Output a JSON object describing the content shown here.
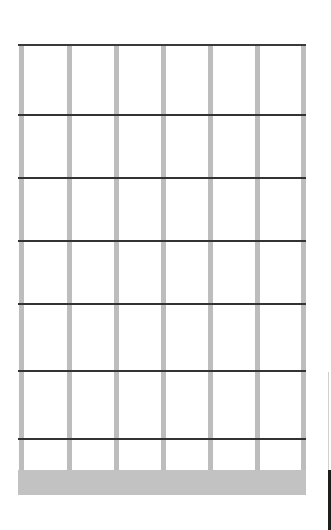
{
  "diagram": {
    "type": "fretboard-grid",
    "strings": 7,
    "frets": 7,
    "colors": {
      "string": "#bdbdbd",
      "fret": "#333333",
      "base": "#c2c2c2",
      "background": "#ffffff"
    },
    "string_x": [
      19,
      67,
      114,
      161,
      208,
      255,
      301
    ],
    "fret_y": [
      44,
      114,
      177,
      240,
      303,
      370,
      438
    ]
  }
}
